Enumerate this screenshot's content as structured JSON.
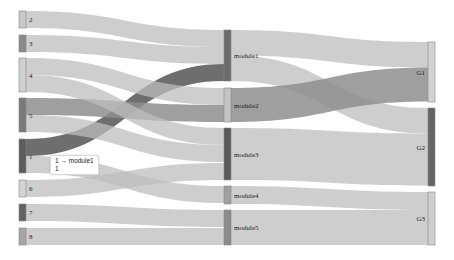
{
  "chart_data": {
    "type": "sankey",
    "title": "",
    "nodes": [
      {
        "id": "2",
        "column": 0,
        "y0": 11,
        "y1": 28,
        "color": "#c8c8c8"
      },
      {
        "id": "3",
        "column": 0,
        "y0": 35,
        "y1": 52,
        "color": "#8a8a8a"
      },
      {
        "id": "4",
        "column": 0,
        "y0": 58,
        "y1": 92,
        "color": "#d0d0d0"
      },
      {
        "id": "5",
        "column": 0,
        "y0": 98,
        "y1": 132,
        "color": "#7a7a7a"
      },
      {
        "id": "1",
        "column": 0,
        "y0": 139,
        "y1": 173,
        "color": "#5c5c5c"
      },
      {
        "id": "6",
        "column": 0,
        "y0": 180,
        "y1": 197,
        "color": "#d4d4d4"
      },
      {
        "id": "7",
        "column": 0,
        "y0": 204,
        "y1": 221,
        "color": "#636363"
      },
      {
        "id": "8",
        "column": 0,
        "y0": 228,
        "y1": 245,
        "color": "#a6a6a6"
      },
      {
        "id": "module1",
        "column": 1,
        "y0": 30,
        "y1": 81,
        "color": "#6a6a6a"
      },
      {
        "id": "module2",
        "column": 1,
        "y0": 88,
        "y1": 122,
        "color": "#c4c4c4"
      },
      {
        "id": "module3",
        "column": 1,
        "y0": 128,
        "y1": 180,
        "color": "#5a5a5a"
      },
      {
        "id": "module4",
        "column": 1,
        "y0": 186,
        "y1": 204,
        "color": "#a0a0a0"
      },
      {
        "id": "module5",
        "column": 1,
        "y0": 210,
        "y1": 245,
        "color": "#8c8c8c"
      },
      {
        "id": "G1",
        "column": 2,
        "y0": 42,
        "y1": 102,
        "color": "#d2d2d2"
      },
      {
        "id": "G2",
        "column": 2,
        "y0": 108,
        "y1": 186,
        "color": "#666666"
      },
      {
        "id": "G3",
        "column": 2,
        "y0": 192,
        "y1": 245,
        "color": "#cfcfcf"
      }
    ],
    "links": [
      {
        "source": "2",
        "target": "module1",
        "value": 1,
        "sy": 11,
        "ty": 30,
        "w": 17,
        "color": "#bdbdbd"
      },
      {
        "source": "3",
        "target": "module1",
        "value": 1,
        "sy": 35,
        "ty": 47,
        "w": 17,
        "color": "#bdbdbd"
      },
      {
        "source": "1",
        "target": "module1",
        "value": 1,
        "sy": 139,
        "ty": 64,
        "w": 17,
        "color": "#555555"
      },
      {
        "source": "4",
        "target": "module2",
        "value": 1,
        "sy": 58,
        "ty": 88,
        "w": 17,
        "color": "#bdbdbd"
      },
      {
        "source": "5",
        "target": "module2",
        "value": 1,
        "sy": 98,
        "ty": 105,
        "w": 17,
        "color": "#8e8e8e"
      },
      {
        "source": "4",
        "target": "module3",
        "value": 1,
        "sy": 75,
        "ty": 128,
        "w": 17,
        "color": "#bdbdbd"
      },
      {
        "source": "5",
        "target": "module3",
        "value": 1,
        "sy": 115,
        "ty": 145,
        "w": 17,
        "color": "#bdbdbd"
      },
      {
        "source": "6",
        "target": "module3",
        "value": 1,
        "sy": 180,
        "ty": 163,
        "w": 17,
        "color": "#bdbdbd"
      },
      {
        "source": "1",
        "target": "module4",
        "value": 1,
        "sy": 156,
        "ty": 186,
        "w": 17,
        "color": "#bdbdbd"
      },
      {
        "source": "7",
        "target": "module5",
        "value": 1,
        "sy": 204,
        "ty": 210,
        "w": 17,
        "color": "#bdbdbd"
      },
      {
        "source": "8",
        "target": "module5",
        "value": 1,
        "sy": 228,
        "ty": 228,
        "w": 17,
        "color": "#bdbdbd"
      },
      {
        "source": "module1",
        "target": "G1",
        "value": 1.5,
        "sy": 30,
        "ty": 42,
        "w": 25.5,
        "color": "#bdbdbd"
      },
      {
        "source": "module1",
        "target": "G2",
        "value": 1.5,
        "sy": 55.5,
        "ty": 108,
        "w": 25.5,
        "color": "#bdbdbd"
      },
      {
        "source": "module2",
        "target": "G1",
        "value": 2,
        "sy": 88,
        "ty": 67.5,
        "w": 34,
        "color": "#8e8e8e"
      },
      {
        "source": "module3",
        "target": "G2",
        "value": 3,
        "sy": 128,
        "ty": 133.5,
        "w": 52,
        "color": "#bdbdbd"
      },
      {
        "source": "module4",
        "target": "G3",
        "value": 1,
        "sy": 186,
        "ty": 192,
        "w": 18,
        "color": "#bdbdbd"
      },
      {
        "source": "module5",
        "target": "G3",
        "value": 2,
        "sy": 210,
        "ty": 210,
        "w": 35,
        "color": "#bdbdbd"
      }
    ],
    "columns_x": [
      19,
      224,
      428
    ],
    "node_width": 7
  },
  "tooltip": {
    "line1": "1 → module1",
    "line2": "1"
  }
}
